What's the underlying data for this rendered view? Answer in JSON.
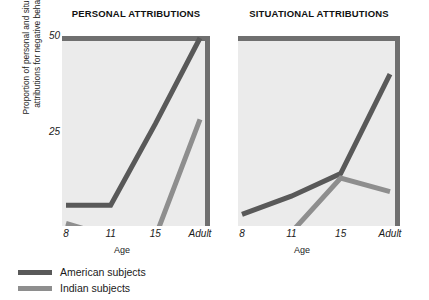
{
  "chart_data": {
    "type": "line",
    "xlabel": "Age",
    "ylabel_line1": "Proportion of personal and situational",
    "ylabel_line2": "attributions for negative behaviors",
    "categories": [
      "8",
      "11",
      "15",
      "Adult"
    ],
    "yticks": [
      "50",
      "25"
    ],
    "ytick_values": [
      50,
      25
    ],
    "ylim": [
      0,
      50
    ],
    "grid": false,
    "legend_position": "bottom-left",
    "panels": [
      {
        "title": "PERSONAL ATTRIBUTIONS",
        "series": [
          {
            "name": "American subjects",
            "color": "#595959",
            "values": [
              13,
              13,
              31,
              50
            ]
          },
          {
            "name": "Indian subjects",
            "color": "#8e8e8e",
            "values": [
              9,
              6,
              6,
              32
            ]
          }
        ]
      },
      {
        "title": "SITUATIONAL ATTRIBUTIONS",
        "series": [
          {
            "name": "American subjects",
            "color": "#595959",
            "values": [
              11,
              15,
              20,
              42
            ]
          },
          {
            "name": "Indian subjects",
            "color": "#8e8e8e",
            "values": [
              7,
              7,
              19,
              16
            ]
          }
        ]
      }
    ],
    "legend": [
      {
        "label": "American subjects",
        "color": "#595959"
      },
      {
        "label": "Indian subjects",
        "color": "#8e8e8e"
      }
    ],
    "colors": {
      "american": "#595959",
      "indian": "#8e8e8e",
      "plot_background": "#ebebeb",
      "panel_edge": "#6f6f6f",
      "page_background": "#ffffff",
      "text": "#1a1a1a"
    }
  }
}
